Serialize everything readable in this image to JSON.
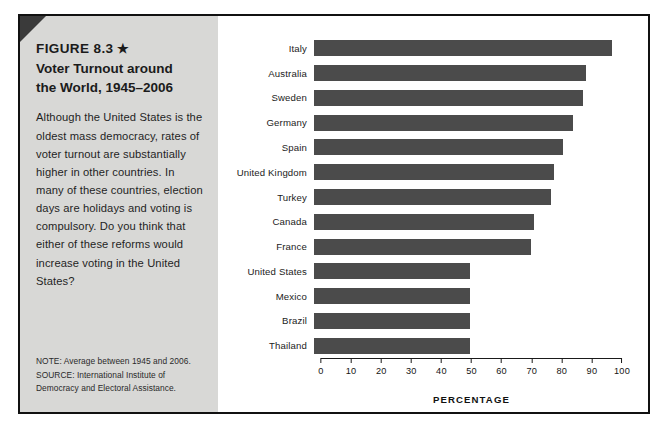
{
  "figure": {
    "number_label": "FIGURE 8.3",
    "star": "★",
    "title": "Voter Turnout around\nthe World, 1945–2006",
    "body": "Although the United States is the oldest mass democracy, rates of voter turnout are substantially higher in other countries. In many of these countries, election days are holidays and voting is compulsory. Do you think that either of these reforms would increase voting in the United States?",
    "note": "NOTE: Average between 1945 and 2006.",
    "source": "SOURCE: International Institute of Democracy and Electoral Assistance.",
    "colors": {
      "bar": "#4b4b4b",
      "sidebar_bg": "#d8d8d6",
      "frame_border": "#111111",
      "corner_fold": "#3a3a3a"
    }
  },
  "chart_data": {
    "type": "bar",
    "orientation": "horizontal",
    "title": "Voter Turnout around the World, 1945–2006",
    "xlabel": "PERCENTAGE",
    "ylabel": "",
    "xlim": [
      0,
      100
    ],
    "xticks": [
      0,
      10,
      20,
      30,
      40,
      50,
      60,
      70,
      80,
      90,
      100
    ],
    "grid": false,
    "legend": null,
    "categories": [
      "Italy",
      "Australia",
      "Sweden",
      "Germany",
      "Spain",
      "United Kingdom",
      "Turkey",
      "Canada",
      "France",
      "United States",
      "Mexico",
      "Brazil",
      "Thailand"
    ],
    "values": [
      92,
      84,
      83,
      80,
      77,
      74,
      73,
      68,
      67,
      48,
      48,
      48,
      48
    ],
    "units": "percent"
  }
}
